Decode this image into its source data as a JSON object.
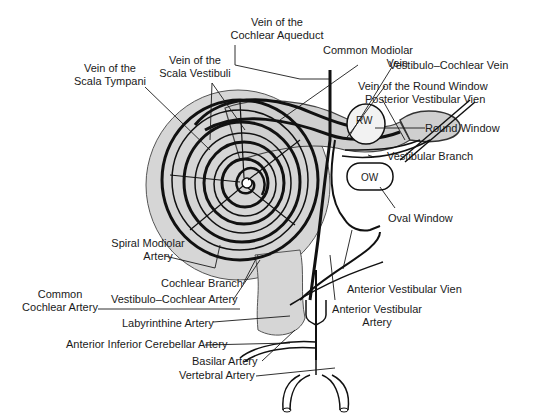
{
  "structures": {
    "round_window_abbrev": "RW",
    "oval_window_abbrev": "OW"
  },
  "labels": {
    "vein_cochlear_aqueduct": [
      "Vein of the",
      "Cochlear Aqueduct"
    ],
    "common_modiolar_vein": [
      "Common Modiolar",
      "Vein"
    ],
    "vestibulo_cochlear_vein": "Vestibulo–Cochlear Vein",
    "vein_round_window": "Vein of the Round Window",
    "posterior_vestibular_vien": "Posterior Vestibular Vien",
    "round_window": "Round Window",
    "vestibular_branch": "Vestibular Branch",
    "oval_window": "Oval Window",
    "vein_scala_tympani": [
      "Vein of the",
      "Scala Tympani"
    ],
    "vein_scala_vestibuli": [
      "Vein of the",
      "Scala Vestibuli"
    ],
    "spiral_modiolar_artery": [
      "Spiral Modiolar",
      "Artery"
    ],
    "cochlear_branch": "Cochlear Branch",
    "vestibulo_cochlear_artery": "Vestibulo–Cochlear Artery",
    "common_cochlear_artery": [
      "Common",
      "Cochlear Artery"
    ],
    "labyrinthine_artery": "Labyrinthine Artery",
    "anterior_inferior_cerebellar_artery": "Anterior Inferior Cerebellar Artery",
    "basilar_artery": "Basilar Artery",
    "vertebral_artery": "Vertebral Artery",
    "anterior_vestibular_vien": "Anterior Vestibular Vien",
    "anterior_vestibular_artery": [
      "Anterior Vestibular",
      "Artery"
    ]
  },
  "colors": {
    "ink": "#1a1a1a",
    "cochlea_fill": "#d4d4d4",
    "canal_fill": "#c8c8c8",
    "background": "#ffffff"
  }
}
